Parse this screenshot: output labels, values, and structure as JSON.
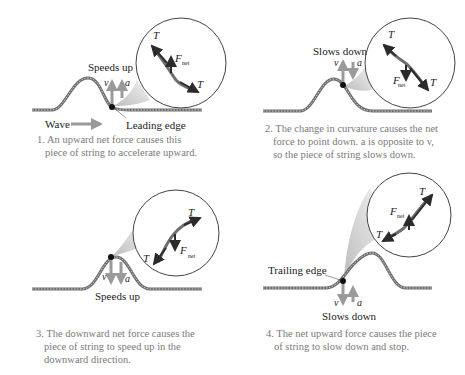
{
  "figure": {
    "panels": [
      {
        "id": 1,
        "motion_label": "Speeds up",
        "wave_label": "Wave",
        "edge_label": "Leading edge",
        "vectors": {
          "v": "v",
          "a": "a",
          "T": "T",
          "F": "F",
          "F_sub": "net"
        },
        "caption_lines": [
          "1. An upward net force causes this",
          "piece of string to accelerate upward."
        ]
      },
      {
        "id": 2,
        "motion_label": "Slows down",
        "vectors": {
          "v": "v",
          "a": "a",
          "T": "T",
          "F": "F",
          "F_sub": "net"
        },
        "caption_lines": [
          "2. The change in curvature causes the net",
          "force to point down. a is opposite to v,",
          "so the piece of string slows down."
        ]
      },
      {
        "id": 3,
        "motion_label": "Speeds up",
        "vectors": {
          "v": "v",
          "a": "a",
          "T": "T",
          "F": "F",
          "F_sub": "net"
        },
        "caption_lines": [
          "3. The downward net force causes the",
          "piece of string to speed up in the",
          "downward direction."
        ]
      },
      {
        "id": 4,
        "motion_label": "Slows down",
        "edge_label": "Trailing edge",
        "vectors": {
          "v": "v",
          "a": "a",
          "T": "T",
          "F": "F",
          "F_sub": "net"
        },
        "caption_lines": [
          "4. The net upward force causes the piece",
          "of string to slow down and stop."
        ]
      }
    ],
    "colors": {
      "string": "#6e6e6e",
      "velocity_arrow": "#9a9a9a",
      "tension_arrow": "#2b2b2b",
      "caption": "#7a7a7a",
      "callout_fill": "#d8d8d8"
    }
  }
}
